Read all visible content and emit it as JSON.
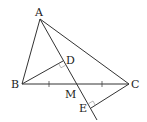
{
  "diagram": {
    "type": "geometry",
    "points": {
      "A": {
        "label": "A",
        "x": 40,
        "y": 19
      },
      "B": {
        "label": "B",
        "x": 22,
        "y": 84
      },
      "C": {
        "label": "C",
        "x": 129,
        "y": 84
      },
      "M": {
        "label": "M",
        "x": 76,
        "y": 84
      },
      "D": {
        "label": "D",
        "x": 63,
        "y": 61
      },
      "E": {
        "label": "E",
        "x": 91,
        "y": 108
      }
    },
    "segments": [
      "AB",
      "AC",
      "BC",
      "AE",
      "BD",
      "CE"
    ],
    "marks": {
      "equal_ticks": [
        "BM",
        "MC"
      ],
      "right_angles": [
        "BD ⊥ AM at D",
        "CE ⊥ AM at E"
      ]
    },
    "colors": {
      "line": "#333333",
      "label": "#222222"
    }
  }
}
